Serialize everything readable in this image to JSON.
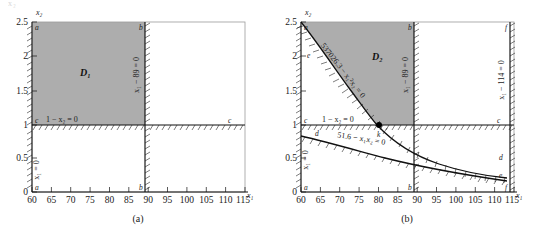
{
  "figure": {
    "top_faint_text": "x₂",
    "panels": [
      {
        "id": "a",
        "caption": "(a)",
        "region_label": "D₁",
        "axis": {
          "xlabel": "x₁",
          "ylabel": "x₂",
          "xticks": [
            "60",
            "65",
            "70",
            "75",
            "80",
            "85",
            "90",
            "95",
            "100",
            "105",
            "110",
            "115"
          ],
          "yticks": [
            "0",
            "0.5",
            "1",
            "1.5",
            "2",
            "2.5"
          ],
          "xlim": [
            60,
            115
          ],
          "ylim": [
            0,
            2.5
          ]
        },
        "constraints": [
          {
            "name": "left-bound",
            "text": "x₁ = 0",
            "value": 60,
            "type": "vertical"
          },
          {
            "name": "upper-x1-bound",
            "text": "x₁ − 89 = 0",
            "value": 89,
            "type": "vertical"
          },
          {
            "name": "lower-x2-bound",
            "text": "1 − x₂ = 0",
            "value": 1,
            "type": "horizontal"
          }
        ],
        "corner_labels": [
          "a",
          "b",
          "c",
          "a",
          "b",
          "c"
        ]
      },
      {
        "id": "b",
        "caption": "(b)",
        "region_label": "D₂",
        "axis": {
          "xlabel": "x₁",
          "ylabel": "x₂",
          "xticks": [
            "60",
            "65",
            "70",
            "75",
            "80",
            "85",
            "90",
            "95",
            "100",
            "105",
            "110",
            "115"
          ],
          "yticks": [
            "0",
            "0.5",
            "1",
            "1.5",
            "2",
            "2.5"
          ],
          "xlim": [
            60,
            115
          ],
          "ylim": [
            0,
            2.5
          ]
        },
        "constraints": [
          {
            "name": "curve-upper",
            "text": "537026.3 − x₁²x₂ = 0",
            "type": "curve"
          },
          {
            "name": "curve-lower",
            "text": "51.6 − x₁x₂ = 0",
            "type": "curve"
          },
          {
            "name": "x1-89",
            "text": "x₁ − 89 = 0",
            "value": 89,
            "type": "vertical"
          },
          {
            "name": "x1-114",
            "text": "x₁ − 114 = 0",
            "value": 114,
            "type": "vertical"
          },
          {
            "name": "x2-lower",
            "text": "1 − x₂ = 0",
            "value": 1,
            "type": "horizontal"
          },
          {
            "name": "left-bound",
            "text": "x₁ = 0",
            "value": 60,
            "type": "vertical"
          }
        ],
        "point": {
          "label": "k",
          "x": 82,
          "y": 1
        },
        "corner_labels": [
          "a",
          "b",
          "c",
          "d",
          "e",
          "f"
        ]
      }
    ],
    "colors": {
      "shaded_region": "#adadad",
      "line": "#111111",
      "background": "#ffffff"
    }
  }
}
